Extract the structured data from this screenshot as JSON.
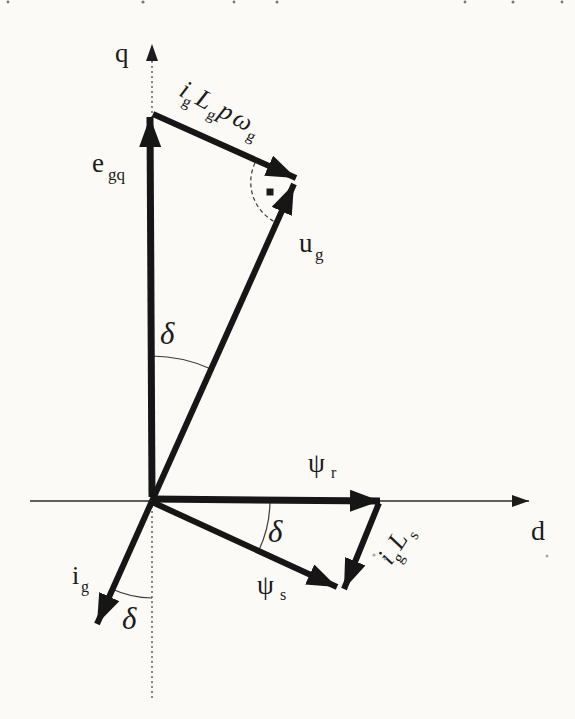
{
  "figure": {
    "background": "#fbfaf7",
    "ink": "#1b1b1b",
    "axis": {
      "q": "q",
      "d": "d"
    },
    "vectors": {
      "e_gq": {
        "main": "e",
        "sub": "gq"
      },
      "u_g": {
        "main": "u",
        "sub": "g"
      },
      "psi_r": {
        "main": "ψ",
        "sub": "r"
      },
      "psi_s": {
        "main": "ψ",
        "sub": "s"
      },
      "i_g": {
        "main": "i",
        "sub": "g"
      },
      "i_g_L_s": {
        "p1": "i",
        "s1": "g",
        "p2": "L",
        "s2": "s"
      },
      "i_g_L_g_p_w_g": {
        "p1": "i",
        "s1": "g",
        "p2": "L",
        "s2": "g",
        "p3": "p",
        "p4": "ω",
        "s4": "g"
      }
    },
    "angles": {
      "delta_eu": "δ",
      "delta_psi": "δ",
      "delta_ig": "δ"
    }
  }
}
